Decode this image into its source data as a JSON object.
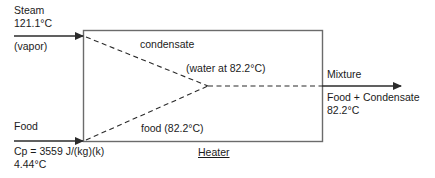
{
  "diagram": {
    "inputs": {
      "steam": {
        "name": "Steam",
        "temperature": "121.1°C",
        "phase": "(vapor)"
      },
      "food": {
        "name": "Food",
        "cp": "Cp = 3559 J/(kg)(k)",
        "temperature": "4.44°C"
      }
    },
    "internal_streams": {
      "condensate": "condensate",
      "condensate_detail": "(water at 82.2°C)",
      "food_stream": "food (82.2°C)"
    },
    "unit": {
      "label": "Heater"
    },
    "output": {
      "name": "Mixture",
      "composition": "Food + Condensate",
      "temperature": "82.2°C"
    },
    "colors": {
      "line": "#2b2b2b",
      "box": "#6b6b6b",
      "text": "#1b1b1b",
      "background": "#ffffff"
    }
  }
}
